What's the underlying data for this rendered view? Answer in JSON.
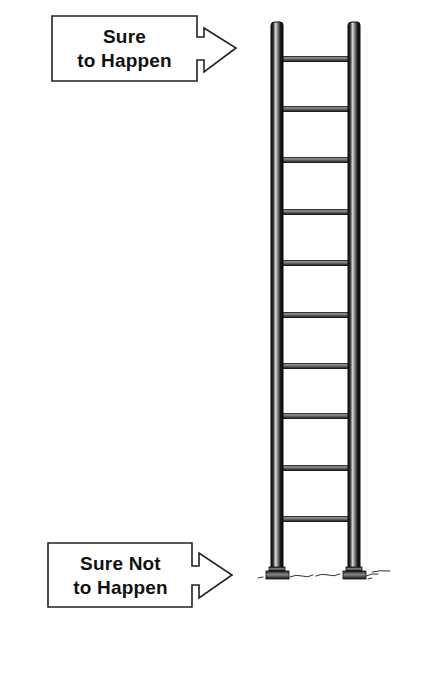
{
  "diagram": {
    "type": "likelihood-ladder",
    "top_label": {
      "line1": "Sure",
      "line2": "to Happen"
    },
    "bottom_label": {
      "line1": "Sure Not",
      "line2": "to Happen"
    },
    "ladder": {
      "rung_count": 10,
      "rail_color": "#1a1a1a",
      "highlight_color": "#bdbdbd"
    },
    "colors": {
      "background": "#ffffff",
      "outline": "#222222",
      "text": "#111111"
    }
  }
}
